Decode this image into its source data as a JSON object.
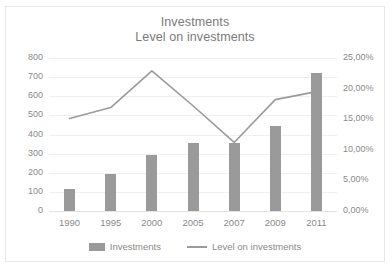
{
  "chart_data": {
    "type": "bar",
    "title": "Investments",
    "subtitle": "Level on investments",
    "xlabel": "",
    "ylabel": "",
    "categories": [
      "1990",
      "1995",
      "2000",
      "2005",
      "2007",
      "2009",
      "2011"
    ],
    "grid": true,
    "legend_position": "bottom",
    "series": [
      {
        "name": "Investments",
        "type": "bar",
        "axis": "left",
        "color": "#9a9a9a",
        "values": [
          115,
          195,
          295,
          355,
          355,
          445,
          720
        ]
      },
      {
        "name": "Level on investments",
        "type": "line",
        "axis": "right",
        "color": "#9a9a9a",
        "values": [
          15.1,
          16.9,
          22.9,
          17.2,
          11.2,
          18.2,
          19.5
        ],
        "value_labels": [
          "15,10%",
          "16,90%",
          "22,90%",
          "17,20%",
          "11,20%",
          "18,20%",
          "19,50%"
        ]
      }
    ],
    "left_axis": {
      "ylim": [
        0,
        800
      ],
      "ticks": [
        0,
        100,
        200,
        300,
        400,
        500,
        600,
        700,
        800
      ],
      "tick_labels": [
        "0",
        "100",
        "200",
        "300",
        "400",
        "500",
        "600",
        "700",
        "800"
      ]
    },
    "right_axis": {
      "ylim": [
        0,
        25
      ],
      "ticks": [
        0,
        5,
        10,
        15,
        20,
        25
      ],
      "tick_labels": [
        "0,00%",
        "5,00%",
        "10,00%",
        "15,00%",
        "20,00%",
        "25,00%"
      ]
    },
    "legend": [
      {
        "label": "Investments",
        "marker": "bar-swatch",
        "color": "#9a9a9a"
      },
      {
        "label": "Level on investments",
        "marker": "line-swatch",
        "color": "#9a9a9a"
      }
    ]
  }
}
